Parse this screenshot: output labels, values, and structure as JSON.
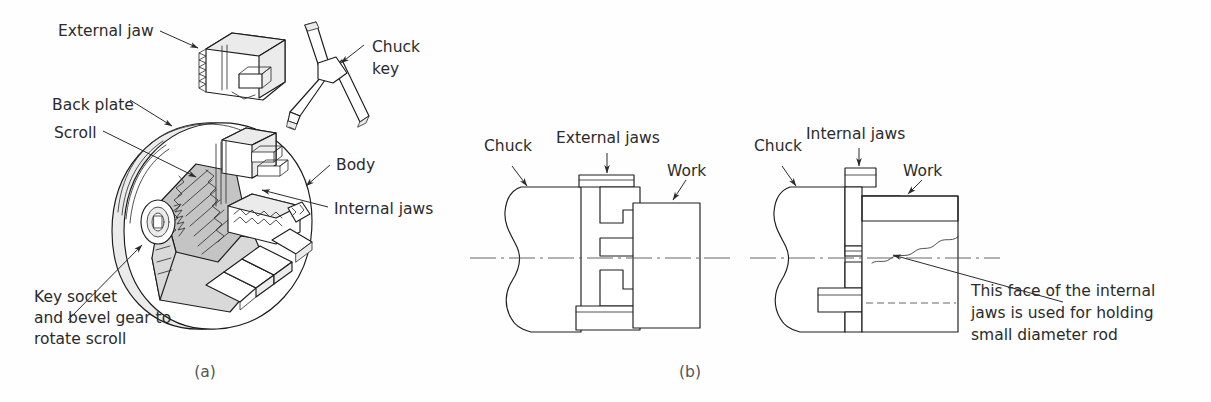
{
  "figure": {
    "background_color": "#fefefe",
    "line_color": "#1c1c1c",
    "text_color": "#2b2b2b"
  },
  "panel_a": {
    "caption": "(a)",
    "labels": {
      "external_jaw": "External jaw",
      "chuck_key_line1": "Chuck",
      "chuck_key_line2": "key",
      "back_plate": "Back plate",
      "scroll": "Scroll",
      "body": "Body",
      "internal_jaws": "Internal jaws",
      "key_socket_line1": "Key socket",
      "key_socket_line2": "and bevel gear to",
      "key_socket_line3": "rotate scroll"
    }
  },
  "panel_b": {
    "caption": "(b)",
    "left_view": {
      "chuck": "Chuck",
      "jaws": "External jaws",
      "work": "Work"
    },
    "right_view": {
      "chuck": "Chuck",
      "jaws": "Internal jaws",
      "work": "Work",
      "note_line1": "This face of the internal",
      "note_line2": "jaws is used for holding",
      "note_line3": "small diameter rod"
    }
  }
}
